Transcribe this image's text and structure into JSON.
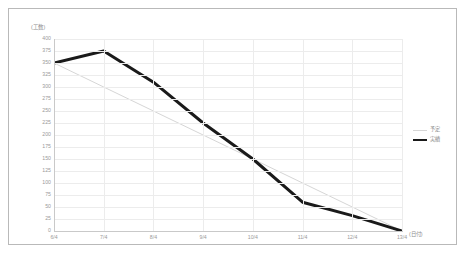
{
  "chart_data": {
    "type": "line",
    "title": "",
    "ylabel": "(工数)",
    "xlabel": "(日付)",
    "categories": [
      "6/4",
      "7/4",
      "8/4",
      "9/4",
      "10/4",
      "11/4",
      "12/4",
      "13/4"
    ],
    "ylim": [
      0,
      400
    ],
    "ytick_labels": [
      "400",
      "375",
      "350",
      "325",
      "300",
      "275",
      "250",
      "225",
      "200",
      "175",
      "150",
      "125",
      "100",
      "75",
      "50",
      "25",
      "0"
    ],
    "ytick_values": [
      400,
      375,
      350,
      325,
      300,
      275,
      250,
      225,
      200,
      175,
      150,
      125,
      100,
      75,
      50,
      25,
      0
    ],
    "grid": true,
    "legend_position": "right",
    "series": [
      {
        "name": "予定",
        "color": "#d6d6d6",
        "width": 1,
        "values": [
          350,
          300,
          250,
          200,
          150,
          100,
          50,
          0
        ]
      },
      {
        "name": "実績",
        "color": "#1a1a1a",
        "width": 3,
        "values": [
          350,
          375,
          310,
          225,
          150,
          60,
          32,
          0
        ]
      }
    ]
  },
  "legend": {
    "entries": [
      {
        "label": "予定",
        "color": "#d6d6d6",
        "thickness": "1px"
      },
      {
        "label": "実績",
        "color": "#1a1a1a",
        "thickness": "2.6px"
      }
    ]
  }
}
